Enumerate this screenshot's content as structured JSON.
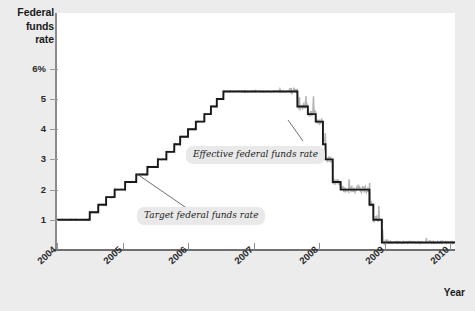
{
  "axes": {
    "y_title_lines": [
      "Federal",
      "funds",
      "rate"
    ],
    "x_title": "Year",
    "y_ticks": [
      {
        "value": 6,
        "label": "6%"
      },
      {
        "value": 5,
        "label": "5"
      },
      {
        "value": 4,
        "label": "4"
      },
      {
        "value": 3,
        "label": "3"
      },
      {
        "value": 2,
        "label": "2"
      },
      {
        "value": 1,
        "label": "1"
      }
    ],
    "x_ticks": [
      "2004",
      "2005",
      "2006",
      "2007",
      "2008",
      "2009",
      "2010"
    ]
  },
  "annotations": {
    "effective": "Effective federal funds rate",
    "target": "Target federal funds rate"
  },
  "colors": {
    "target_line": "#1a1a1a",
    "effective_line": "#b4b4b6",
    "plot_background": "#ffffff",
    "page_background": "#ececed",
    "axis": "#8b8b8d",
    "annotation_background": "#e9e9ea"
  },
  "chart_data": {
    "type": "line",
    "title": "",
    "xlabel": "Year",
    "ylabel": "Federal funds rate",
    "xlim": [
      2004.0,
      2010.1
    ],
    "ylim": [
      0,
      6.6
    ],
    "ytick_values": [
      1,
      2,
      3,
      4,
      5,
      6
    ],
    "xtick_values": [
      2004,
      2005,
      2006,
      2007,
      2008,
      2009,
      2010
    ],
    "grid": false,
    "legend": "inline-annotations",
    "series": [
      {
        "name": "Target federal funds rate",
        "color": "#1a1a1a",
        "style": "step",
        "points": [
          [
            2004.0,
            1.0
          ],
          [
            2004.5,
            1.0
          ],
          [
            2004.5,
            1.25
          ],
          [
            2004.63,
            1.25
          ],
          [
            2004.63,
            1.5
          ],
          [
            2004.75,
            1.5
          ],
          [
            2004.75,
            1.75
          ],
          [
            2004.88,
            1.75
          ],
          [
            2004.88,
            2.0
          ],
          [
            2005.04,
            2.0
          ],
          [
            2005.04,
            2.25
          ],
          [
            2005.21,
            2.25
          ],
          [
            2005.21,
            2.5
          ],
          [
            2005.38,
            2.5
          ],
          [
            2005.38,
            2.75
          ],
          [
            2005.54,
            2.75
          ],
          [
            2005.54,
            3.0
          ],
          [
            2005.67,
            3.0
          ],
          [
            2005.67,
            3.25
          ],
          [
            2005.79,
            3.25
          ],
          [
            2005.79,
            3.5
          ],
          [
            2005.88,
            3.5
          ],
          [
            2005.88,
            3.75
          ],
          [
            2006.0,
            3.75
          ],
          [
            2006.0,
            4.0
          ],
          [
            2006.12,
            4.0
          ],
          [
            2006.12,
            4.25
          ],
          [
            2006.25,
            4.25
          ],
          [
            2006.25,
            4.5
          ],
          [
            2006.35,
            4.5
          ],
          [
            2006.35,
            4.75
          ],
          [
            2006.44,
            4.75
          ],
          [
            2006.44,
            5.0
          ],
          [
            2006.54,
            5.0
          ],
          [
            2006.54,
            5.25
          ],
          [
            2007.67,
            5.25
          ],
          [
            2007.67,
            4.75
          ],
          [
            2007.83,
            4.75
          ],
          [
            2007.83,
            4.5
          ],
          [
            2007.95,
            4.5
          ],
          [
            2007.95,
            4.25
          ],
          [
            2008.06,
            4.25
          ],
          [
            2008.06,
            3.5
          ],
          [
            2008.1,
            3.5
          ],
          [
            2008.1,
            3.0
          ],
          [
            2008.21,
            3.0
          ],
          [
            2008.21,
            2.25
          ],
          [
            2008.33,
            2.25
          ],
          [
            2008.33,
            2.0
          ],
          [
            2008.77,
            2.0
          ],
          [
            2008.77,
            1.5
          ],
          [
            2008.83,
            1.5
          ],
          [
            2008.83,
            1.0
          ],
          [
            2008.96,
            1.0
          ],
          [
            2008.96,
            0.25
          ],
          [
            2010.1,
            0.25
          ]
        ]
      },
      {
        "name": "Effective federal funds rate",
        "color": "#b4b4b6",
        "style": "noisy-line",
        "note": "Daily effective rate tracking the target with spikes; notable volatility late 2007 through 2008."
      }
    ]
  }
}
